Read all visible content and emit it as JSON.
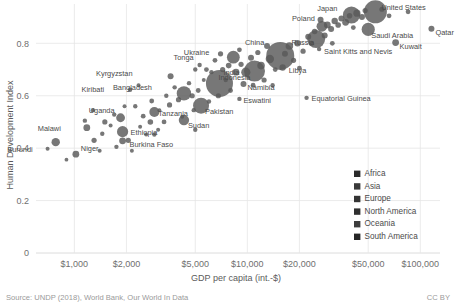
{
  "chart_data": {
    "type": "scatter",
    "title": "",
    "xlabel": "GDP per capita (int.-$)",
    "ylabel": "Human Development Index",
    "xscale": "log",
    "xlim": [
      600,
      130000
    ],
    "ylim": [
      0,
      0.95
    ],
    "grid": true,
    "xticks": [
      1000,
      2000,
      5000,
      10000,
      20000,
      50000,
      100000
    ],
    "xticklabels": [
      "$1,000",
      "$2,000",
      "$5,000",
      "$10,000",
      "$20,000",
      "$50,000",
      "$100,000"
    ],
    "yticks": [
      0,
      0.2,
      0.4,
      0.6,
      0.8
    ],
    "yticklabels": [
      "0",
      "0.2",
      "0.4",
      "0.6",
      "0.8"
    ],
    "legend_position": "lower-right",
    "legend": [
      {
        "label": "Africa",
        "color": "#2b2b2b"
      },
      {
        "label": "Asia",
        "color": "#3a3a3a"
      },
      {
        "label": "Europe",
        "color": "#343434"
      },
      {
        "label": "North America",
        "color": "#2f2f2f"
      },
      {
        "label": "Oceania",
        "color": "#3d3d3d"
      },
      {
        "label": "South America",
        "color": "#262626"
      }
    ],
    "size_encoding": "population",
    "points": [
      {
        "name": "Burundi",
        "x": 780,
        "y": 0.423,
        "r": 4.2,
        "label": true,
        "lx": -23,
        "ly": 10
      },
      {
        "name": "Niger",
        "x": 1020,
        "y": 0.377,
        "r": 3.4,
        "label": true,
        "lx": 5,
        "ly": -3
      },
      {
        "name": "Malawi",
        "x": 1180,
        "y": 0.478,
        "r": 3.4,
        "label": true,
        "lx": -26,
        "ly": 3
      },
      {
        "name": "Ethiopia",
        "x": 1900,
        "y": 0.463,
        "r": 5.6,
        "label": true,
        "lx": 8,
        "ly": 3
      },
      {
        "name": "Uganda",
        "x": 1850,
        "y": 0.516,
        "r": 4.4,
        "label": true,
        "lx": -6,
        "ly": -5
      },
      {
        "name": "Burkina Faso",
        "x": 1900,
        "y": 0.428,
        "r": 3.4,
        "label": true,
        "lx": 7,
        "ly": 6
      },
      {
        "name": "Tanzania",
        "x": 2900,
        "y": 0.538,
        "r": 5.0,
        "label": true,
        "lx": 4,
        "ly": 4
      },
      {
        "name": "Kiribati",
        "x": 2100,
        "y": 0.623,
        "r": 2.2,
        "label": true,
        "lx": -26,
        "ly": 2
      },
      {
        "name": "Bangladesh",
        "x": 4300,
        "y": 0.609,
        "r": 7.2,
        "label": true,
        "lx": -32,
        "ly": -3
      },
      {
        "name": "Kyrgyzstan",
        "x": 3600,
        "y": 0.674,
        "r": 3.0,
        "label": true,
        "lx": -38,
        "ly": 0
      },
      {
        "name": "Tonga",
        "x": 5300,
        "y": 0.717,
        "r": 2.2,
        "label": true,
        "lx": -6,
        "ly": -5
      },
      {
        "name": "India",
        "x": 6900,
        "y": 0.647,
        "r": 13.5,
        "label": true,
        "lx": 4,
        "ly": -8
      },
      {
        "name": "Pakistan",
        "x": 5400,
        "y": 0.562,
        "r": 8.0,
        "label": true,
        "lx": 4,
        "ly": 8
      },
      {
        "name": "Sudan",
        "x": 4300,
        "y": 0.507,
        "r": 5.2,
        "label": true,
        "lx": 4,
        "ly": 8
      },
      {
        "name": "Eswatini",
        "x": 9000,
        "y": 0.588,
        "r": 2.2,
        "label": true,
        "lx": 4,
        "ly": 4
      },
      {
        "name": "Namibia",
        "x": 9500,
        "y": 0.645,
        "r": 3.0,
        "label": true,
        "lx": 4,
        "ly": 6
      },
      {
        "name": "Indonesia",
        "x": 11000,
        "y": 0.694,
        "r": 10.5,
        "label": true,
        "lx": -4,
        "ly": 9
      },
      {
        "name": "Libya",
        "x": 16000,
        "y": 0.708,
        "r": 3.2,
        "label": true,
        "lx": 6,
        "ly": 6
      },
      {
        "name": "Ukraine",
        "x": 8300,
        "y": 0.747,
        "r": 6.4,
        "label": true,
        "lx": -24,
        "ly": -2
      },
      {
        "name": "China",
        "x": 15500,
        "y": 0.752,
        "r": 14.0,
        "label": true,
        "lx": -16,
        "ly": -11
      },
      {
        "name": "Equatorial Guinea",
        "x": 22000,
        "y": 0.592,
        "r": 2.2,
        "label": true,
        "lx": 5,
        "ly": 3
      },
      {
        "name": "Russia",
        "x": 25000,
        "y": 0.816,
        "r": 9.0,
        "label": true,
        "lx": -2,
        "ly": 6
      },
      {
        "name": "Poland",
        "x": 27000,
        "y": 0.865,
        "r": 5.4,
        "label": true,
        "lx": -7,
        "ly": -5
      },
      {
        "name": "Saint Kitts and Nevis",
        "x": 26000,
        "y": 0.778,
        "r": 2.2,
        "label": true,
        "lx": 5,
        "ly": 5
      },
      {
        "name": "Kuwait",
        "x": 72000,
        "y": 0.803,
        "r": 3.4,
        "label": true,
        "lx": 4,
        "ly": 6
      },
      {
        "name": "Saudi Arabia",
        "x": 50000,
        "y": 0.853,
        "r": 6.6,
        "label": true,
        "lx": 3,
        "ly": 9
      },
      {
        "name": "Qatar",
        "x": 116000,
        "y": 0.856,
        "r": 3.0,
        "label": true,
        "lx": 4,
        "ly": 6
      },
      {
        "name": "Japan",
        "x": 40000,
        "y": 0.908,
        "r": 8.6,
        "label": true,
        "lx": -14,
        "ly": -4
      },
      {
        "name": "United States",
        "x": 55000,
        "y": 0.92,
        "r": 11.5,
        "label": true,
        "lx": 6,
        "ly": -2
      },
      {
        "name": "u1",
        "x": 700,
        "y": 0.398,
        "r": 2.0,
        "label": false
      },
      {
        "name": "u2",
        "x": 900,
        "y": 0.356,
        "r": 1.9,
        "label": false
      },
      {
        "name": "u3",
        "x": 1300,
        "y": 0.43,
        "r": 2.6,
        "label": false
      },
      {
        "name": "u4",
        "x": 1450,
        "y": 0.455,
        "r": 2.2,
        "label": false
      },
      {
        "name": "u5",
        "x": 1500,
        "y": 0.5,
        "r": 2.6,
        "label": false
      },
      {
        "name": "u6",
        "x": 1620,
        "y": 0.486,
        "r": 2.0,
        "label": false
      },
      {
        "name": "u7",
        "x": 1700,
        "y": 0.528,
        "r": 2.2,
        "label": false
      },
      {
        "name": "u8",
        "x": 1750,
        "y": 0.405,
        "r": 2.2,
        "label": false
      },
      {
        "name": "u9",
        "x": 2050,
        "y": 0.43,
        "r": 2.6,
        "label": false
      },
      {
        "name": "u10",
        "x": 2150,
        "y": 0.39,
        "r": 2.0,
        "label": false
      },
      {
        "name": "u11",
        "x": 2250,
        "y": 0.56,
        "r": 2.2,
        "label": false
      },
      {
        "name": "u12",
        "x": 2400,
        "y": 0.482,
        "r": 2.0,
        "label": false
      },
      {
        "name": "u13",
        "x": 2500,
        "y": 0.522,
        "r": 2.4,
        "label": false
      },
      {
        "name": "u14",
        "x": 2750,
        "y": 0.5,
        "r": 2.8,
        "label": false
      },
      {
        "name": "u15",
        "x": 2800,
        "y": 0.58,
        "r": 2.4,
        "label": false
      },
      {
        "name": "u16",
        "x": 3100,
        "y": 0.545,
        "r": 2.0,
        "label": false
      },
      {
        "name": "u17",
        "x": 3300,
        "y": 0.5,
        "r": 2.4,
        "label": false
      },
      {
        "name": "u18",
        "x": 3400,
        "y": 0.6,
        "r": 2.2,
        "label": false
      },
      {
        "name": "u19",
        "x": 3550,
        "y": 0.565,
        "r": 2.6,
        "label": false
      },
      {
        "name": "u20",
        "x": 3800,
        "y": 0.632,
        "r": 2.2,
        "label": false
      },
      {
        "name": "u21",
        "x": 4000,
        "y": 0.585,
        "r": 2.6,
        "label": false
      },
      {
        "name": "u22",
        "x": 4200,
        "y": 0.52,
        "r": 2.0,
        "label": false
      },
      {
        "name": "u23",
        "x": 4600,
        "y": 0.648,
        "r": 2.2,
        "label": false
      },
      {
        "name": "u24",
        "x": 4800,
        "y": 0.6,
        "r": 2.6,
        "label": false
      },
      {
        "name": "u25",
        "x": 5000,
        "y": 0.7,
        "r": 2.2,
        "label": false
      },
      {
        "name": "u26",
        "x": 5200,
        "y": 0.62,
        "r": 2.4,
        "label": false
      },
      {
        "name": "u27",
        "x": 5600,
        "y": 0.66,
        "r": 2.0,
        "label": false
      },
      {
        "name": "u28",
        "x": 5800,
        "y": 0.7,
        "r": 2.4,
        "label": false
      },
      {
        "name": "u29",
        "x": 6200,
        "y": 0.69,
        "r": 2.2,
        "label": false
      },
      {
        "name": "u30",
        "x": 6500,
        "y": 0.735,
        "r": 2.4,
        "label": false
      },
      {
        "name": "u31",
        "x": 6800,
        "y": 0.6,
        "r": 2.6,
        "label": false
      },
      {
        "name": "u32",
        "x": 7200,
        "y": 0.7,
        "r": 2.6,
        "label": false
      },
      {
        "name": "u33",
        "x": 7500,
        "y": 0.66,
        "r": 2.2,
        "label": false
      },
      {
        "name": "u34",
        "x": 7800,
        "y": 0.715,
        "r": 2.8,
        "label": false
      },
      {
        "name": "u35",
        "x": 8000,
        "y": 0.62,
        "r": 2.4,
        "label": false
      },
      {
        "name": "u36",
        "x": 8600,
        "y": 0.69,
        "r": 3.4,
        "label": false
      },
      {
        "name": "u37",
        "x": 9200,
        "y": 0.72,
        "r": 2.6,
        "label": false
      },
      {
        "name": "u38",
        "x": 9800,
        "y": 0.69,
        "r": 4.6,
        "label": false
      },
      {
        "name": "u39",
        "x": 10500,
        "y": 0.745,
        "r": 3.0,
        "label": false
      },
      {
        "name": "u40",
        "x": 11500,
        "y": 0.765,
        "r": 2.6,
        "label": false
      },
      {
        "name": "u41",
        "x": 12000,
        "y": 0.715,
        "r": 3.8,
        "label": false
      },
      {
        "name": "u42",
        "x": 12500,
        "y": 0.66,
        "r": 2.6,
        "label": false
      },
      {
        "name": "u43",
        "x": 13000,
        "y": 0.79,
        "r": 3.0,
        "label": false
      },
      {
        "name": "u44",
        "x": 13500,
        "y": 0.74,
        "r": 4.2,
        "label": false
      },
      {
        "name": "u45",
        "x": 14500,
        "y": 0.7,
        "r": 2.4,
        "label": false
      },
      {
        "name": "u46",
        "x": 16500,
        "y": 0.76,
        "r": 3.0,
        "label": false
      },
      {
        "name": "u47",
        "x": 17500,
        "y": 0.79,
        "r": 3.8,
        "label": false
      },
      {
        "name": "u48",
        "x": 18500,
        "y": 0.735,
        "r": 2.6,
        "label": false
      },
      {
        "name": "u49",
        "x": 19500,
        "y": 0.8,
        "r": 3.2,
        "label": false
      },
      {
        "name": "u50",
        "x": 21000,
        "y": 0.77,
        "r": 2.6,
        "label": false
      },
      {
        "name": "u51",
        "x": 22500,
        "y": 0.825,
        "r": 3.0,
        "label": false
      },
      {
        "name": "u52",
        "x": 23500,
        "y": 0.8,
        "r": 2.6,
        "label": false
      },
      {
        "name": "u53",
        "x": 24500,
        "y": 0.845,
        "r": 2.8,
        "label": false
      },
      {
        "name": "u54",
        "x": 28000,
        "y": 0.83,
        "r": 3.0,
        "label": false
      },
      {
        "name": "u55",
        "x": 29000,
        "y": 0.87,
        "r": 3.4,
        "label": false
      },
      {
        "name": "u56",
        "x": 30500,
        "y": 0.855,
        "r": 3.0,
        "label": false
      },
      {
        "name": "u57",
        "x": 32000,
        "y": 0.885,
        "r": 3.2,
        "label": false
      },
      {
        "name": "u58",
        "x": 33500,
        "y": 0.87,
        "r": 2.8,
        "label": false
      },
      {
        "name": "u59",
        "x": 35000,
        "y": 0.895,
        "r": 3.0,
        "label": false
      },
      {
        "name": "u60",
        "x": 37000,
        "y": 0.88,
        "r": 3.4,
        "label": false
      },
      {
        "name": "u61",
        "x": 39000,
        "y": 0.905,
        "r": 2.8,
        "label": false
      },
      {
        "name": "u62",
        "x": 43000,
        "y": 0.915,
        "r": 3.6,
        "label": false
      },
      {
        "name": "u63",
        "x": 46000,
        "y": 0.9,
        "r": 3.0,
        "label": false
      },
      {
        "name": "u64",
        "x": 48000,
        "y": 0.925,
        "r": 2.6,
        "label": false
      },
      {
        "name": "u65",
        "x": 60000,
        "y": 0.93,
        "r": 2.6,
        "label": false
      },
      {
        "name": "u66",
        "x": 66000,
        "y": 0.905,
        "r": 2.4,
        "label": false
      },
      {
        "name": "u67",
        "x": 85000,
        "y": 0.92,
        "r": 2.4,
        "label": false
      },
      {
        "name": "u68",
        "x": 1150,
        "y": 0.505,
        "r": 2.2,
        "label": false
      },
      {
        "name": "u69",
        "x": 2900,
        "y": 0.452,
        "r": 2.2,
        "label": false
      },
      {
        "name": "u70",
        "x": 3050,
        "y": 0.47,
        "r": 2.0,
        "label": false
      },
      {
        "name": "u71",
        "x": 1950,
        "y": 0.56,
        "r": 2.0,
        "label": false
      },
      {
        "name": "u72",
        "x": 2600,
        "y": 0.452,
        "r": 2.0,
        "label": false
      },
      {
        "name": "u73",
        "x": 4900,
        "y": 0.545,
        "r": 2.2,
        "label": false
      },
      {
        "name": "u74",
        "x": 6000,
        "y": 0.578,
        "r": 2.2,
        "label": false
      },
      {
        "name": "u75",
        "x": 7000,
        "y": 0.76,
        "r": 2.6,
        "label": false
      },
      {
        "name": "u76",
        "x": 9000,
        "y": 0.775,
        "r": 2.4,
        "label": false
      },
      {
        "name": "u77",
        "x": 10800,
        "y": 0.64,
        "r": 2.4,
        "label": false
      },
      {
        "name": "u78",
        "x": 14000,
        "y": 0.64,
        "r": 2.2,
        "label": false
      },
      {
        "name": "u79",
        "x": 20000,
        "y": 0.705,
        "r": 2.4,
        "label": false
      },
      {
        "name": "u80",
        "x": 26500,
        "y": 0.89,
        "r": 3.0,
        "label": false
      },
      {
        "name": "u81",
        "x": 2350,
        "y": 0.64,
        "r": 2.0,
        "label": false
      },
      {
        "name": "u82",
        "x": 1400,
        "y": 0.39,
        "r": 2.0,
        "label": false
      },
      {
        "name": "u83",
        "x": 5000,
        "y": 0.47,
        "r": 2.2,
        "label": false
      },
      {
        "name": "u84",
        "x": 1280,
        "y": 0.545,
        "r": 2.2,
        "label": false
      },
      {
        "name": "u85",
        "x": 31000,
        "y": 0.8,
        "r": 2.4,
        "label": false
      },
      {
        "name": "u86",
        "x": 41000,
        "y": 0.86,
        "r": 2.4,
        "label": false
      }
    ]
  },
  "footer": {
    "source": "Source: UNDP (2018), World Bank, Our World In Data",
    "license": "CC BY"
  }
}
